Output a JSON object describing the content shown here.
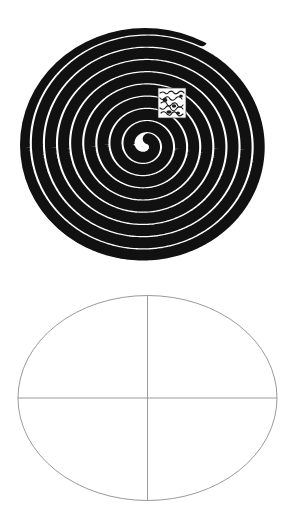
{
  "page": {
    "background_color": "#ffffff",
    "width": 296,
    "height": 530
  },
  "figures": [
    {
      "id": "spiral-figure",
      "name": "hypnotic-spiral",
      "caption": "",
      "ink_color": "#111111",
      "paper_color": "#ffffff",
      "bounds": {
        "left": 20,
        "top": 28,
        "right": 270,
        "bottom": 262
      },
      "center": {
        "x": 155,
        "y": 103
      },
      "turns": 9,
      "stroke_width": 11,
      "center_inset": {
        "name": "scribble-patch",
        "text": "illegible handwritten scribble",
        "bounds": {
          "left": 158,
          "top": 88,
          "right": 186,
          "bottom": 118
        }
      }
    },
    {
      "id": "ellipse-figure",
      "name": "ellipse-with-axes",
      "caption": "",
      "line_color": "#8a8a8a",
      "fill_color": "#ffffff",
      "stroke_width": 0.9,
      "bounds": {
        "left": 18,
        "top": 295,
        "right": 277,
        "bottom": 500
      },
      "center": {
        "x": 146,
        "y": 398
      },
      "radius_x": 130,
      "radius_y": 103,
      "axes": [
        {
          "name": "vertical-axis",
          "orientation": "vertical",
          "x": 146,
          "y1": 295,
          "y2": 500
        },
        {
          "name": "horizontal-axis",
          "orientation": "horizontal",
          "y": 398,
          "x1": 18,
          "x2": 277
        }
      ]
    }
  ],
  "chart_data": {
    "type": "scatter",
    "title": "",
    "xlabel": "",
    "ylabel": "",
    "grid": false,
    "legend": null,
    "panels": [
      {
        "name": "spiral",
        "type": "archimedean-spiral",
        "description": "High-contrast black and white concentric spiral (optical illusion target), slightly elliptical, ~9 visible turns of thick black band alternating with white.",
        "turns": 9,
        "center": [
          155,
          103
        ],
        "outer_radius_x": 125,
        "outer_radius_y": 117,
        "band_thickness": 11
      },
      {
        "name": "ellipse-axes",
        "type": "ellipse",
        "description": "Thin grey outlined ellipse bisected by a vertical and a horizontal axis line, dividing it into four quadrants.",
        "center": [
          146,
          398
        ],
        "radius_x": 130,
        "radius_y": 103,
        "quadrants": 4
      }
    ]
  }
}
